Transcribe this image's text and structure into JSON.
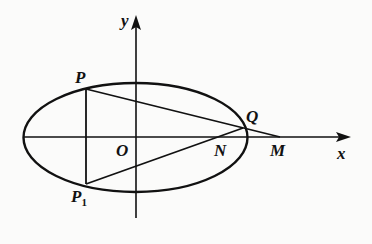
{
  "diagram": {
    "type": "ellipse-geometry",
    "axes": {
      "x_label": "x",
      "y_label": "y"
    },
    "origin_label": "O",
    "points": [
      {
        "name": "P",
        "label": "P"
      },
      {
        "name": "P1",
        "label": "P",
        "subscript": "1"
      },
      {
        "name": "Q",
        "label": "Q"
      },
      {
        "name": "N",
        "label": "N"
      },
      {
        "name": "M",
        "label": "M"
      }
    ],
    "segments": [
      "PP1",
      "PQ",
      "QM",
      "P1Q"
    ],
    "colors": {
      "stroke": "#111111",
      "background": "#fbfbfa"
    }
  }
}
